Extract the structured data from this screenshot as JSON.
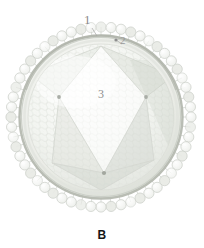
{
  "figure": {
    "panel_letter": "B",
    "background_color": "#ffffff"
  },
  "callouts": [
    {
      "id": "1",
      "label": "1",
      "refers_to": "surface glycoprotein spike",
      "x": 88,
      "y": 20,
      "color": "#8a8a8a",
      "leader": {
        "x1": 92,
        "y1": 28,
        "x2": 97,
        "y2": 36
      }
    },
    {
      "id": "2",
      "label": "2",
      "refers_to": "lipid envelope membrane",
      "x": 124,
      "y": 42,
      "color": "#9a9a9a",
      "leader": {
        "x1": 122,
        "y1": 44,
        "x2": 116,
        "y2": 40
      }
    },
    {
      "id": "3",
      "label": "3",
      "refers_to": "icosahedral nucleocapsid core",
      "x": 102,
      "y": 95,
      "color": "#8f8f8f"
    }
  ],
  "geometry": {
    "center_x": 101,
    "center_y": 117,
    "envelope_outer_radius": 84,
    "envelope_inner_radius": 79,
    "capsid_radius": 73,
    "spike_count": 56,
    "spike_head_radius": 5.1,
    "spike_stem_length": 7,
    "capsomer_rows": 26
  },
  "colors": {
    "envelope_ring": "#b9bdb4",
    "envelope_ring_light": "#d4d8d0",
    "capsid_fill": "#f4f5f2",
    "capsid_shade": "#e2e5df",
    "capsid_lattice": "#dfe2dc",
    "spike_stroke": "#cdd1ca",
    "spike_fill": "#f7f8f6",
    "vertex_dot": "#a9ada6",
    "facet_edge": "#d8dcd5",
    "label_text": "#8d8d8d",
    "panel_letter": "#161616"
  },
  "vertices": [
    {
      "name": "left-vertex",
      "x": 59,
      "y": 97
    },
    {
      "name": "right-vertex",
      "x": 146,
      "y": 97
    },
    {
      "name": "bottom-vertex",
      "x": 104,
      "y": 173
    }
  ]
}
